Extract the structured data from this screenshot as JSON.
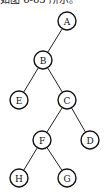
{
  "caption": "如图 6-65 所示。",
  "tree": {
    "nodes": [
      {
        "id": "A",
        "label": "A",
        "x": 67,
        "y": 21
      },
      {
        "id": "B",
        "label": "B",
        "x": 43,
        "y": 60
      },
      {
        "id": "E",
        "label": "E",
        "x": 19,
        "y": 100
      },
      {
        "id": "C",
        "label": "C",
        "x": 67,
        "y": 100
      },
      {
        "id": "F",
        "label": "F",
        "x": 42,
        "y": 140
      },
      {
        "id": "D",
        "label": "D",
        "x": 90,
        "y": 140
      },
      {
        "id": "H",
        "label": "H",
        "x": 19,
        "y": 178
      },
      {
        "id": "G",
        "label": "G",
        "x": 67,
        "y": 178
      }
    ],
    "edges": [
      {
        "from": "A",
        "to": "B"
      },
      {
        "from": "B",
        "to": "E"
      },
      {
        "from": "B",
        "to": "C"
      },
      {
        "from": "C",
        "to": "F"
      },
      {
        "from": "C",
        "to": "D"
      },
      {
        "from": "F",
        "to": "H"
      },
      {
        "from": "F",
        "to": "G"
      }
    ],
    "node_radius": 9
  }
}
